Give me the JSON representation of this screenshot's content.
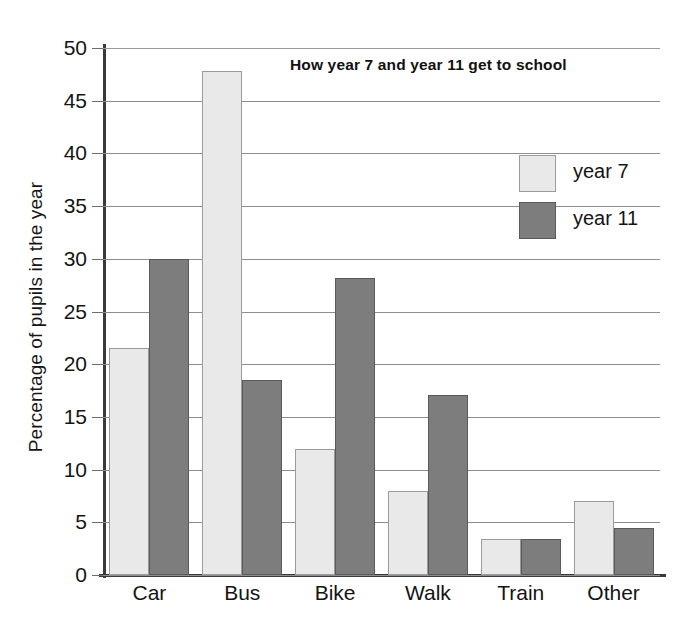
{
  "chart_data": {
    "type": "bar",
    "title": "How year 7 and year 11 get to school",
    "xlabel": "",
    "ylabel": "Percentage of pupils in the year",
    "categories": [
      "Car",
      "Bus",
      "Bike",
      "Walk",
      "Train",
      "Other"
    ],
    "series": [
      {
        "name": "year 7",
        "values": [
          21.5,
          47.8,
          12.0,
          8.0,
          3.4,
          7.0
        ],
        "color": "#e9e9e9"
      },
      {
        "name": "year 11",
        "values": [
          30.0,
          18.5,
          28.2,
          17.1,
          3.4,
          4.5
        ],
        "color": "#7d7d7d"
      }
    ],
    "ylim": [
      0,
      50
    ],
    "ytick_values": [
      0,
      5,
      10,
      15,
      20,
      25,
      30,
      35,
      40,
      45,
      50
    ],
    "ytick_labels": [
      "0",
      "5",
      "10",
      "15",
      "20",
      "25",
      "30",
      "35",
      "40",
      "45",
      "50"
    ],
    "grid": true,
    "legend_position": "upper right",
    "legend_entries": [
      "year 7",
      "year 11"
    ]
  },
  "axis": {
    "y_title": "Percentage of pupils in the year"
  }
}
